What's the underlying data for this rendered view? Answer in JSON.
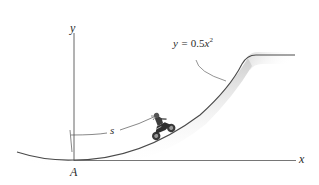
{
  "diagram": {
    "axes": {
      "x_label": "x",
      "y_label": "y",
      "origin_label": "A"
    },
    "curve": {
      "equation_label_prefix": "y = ",
      "equation_coef": "0.5",
      "equation_var": "x",
      "equation_exp": "2"
    },
    "arc_length_label": "s",
    "colors": {
      "line": "#555555",
      "shadow": "#d9d9d9",
      "text": "#2b2b2b"
    }
  }
}
